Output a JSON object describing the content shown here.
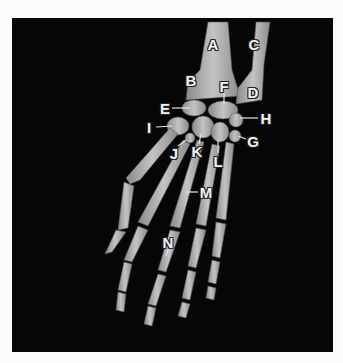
{
  "figure": {
    "background_color": "#060606",
    "bone_color": "#b9b9b9",
    "label_color": "#f2f2f2",
    "labels": [
      {
        "id": "A",
        "text": "A",
        "x": 213,
        "y": 44,
        "target": "radius shaft"
      },
      {
        "id": "C",
        "text": "C",
        "x": 254,
        "y": 44,
        "target": "ulna shaft"
      },
      {
        "id": "B",
        "text": "B",
        "x": 191,
        "y": 80,
        "target": "distal radius"
      },
      {
        "id": "F",
        "text": "F",
        "x": 224,
        "y": 86,
        "target": "carpal"
      },
      {
        "id": "D",
        "text": "D",
        "x": 253,
        "y": 92,
        "target": "distal ulna"
      },
      {
        "id": "E",
        "text": "E",
        "x": 165,
        "y": 108,
        "target": "carpal"
      },
      {
        "id": "H",
        "text": "H",
        "x": 266,
        "y": 118,
        "target": "carpal"
      },
      {
        "id": "I",
        "text": "I",
        "x": 149,
        "y": 127,
        "target": "carpal"
      },
      {
        "id": "G",
        "text": "G",
        "x": 253,
        "y": 141,
        "target": "carpal"
      },
      {
        "id": "J",
        "text": "J",
        "x": 174,
        "y": 153,
        "target": "carpal"
      },
      {
        "id": "K",
        "text": "K",
        "x": 197,
        "y": 151,
        "target": "carpal"
      },
      {
        "id": "L",
        "text": "L",
        "x": 218,
        "y": 161,
        "target": "carpal"
      },
      {
        "id": "M",
        "text": "M",
        "x": 206,
        "y": 192,
        "target": "metacarpal"
      },
      {
        "id": "N",
        "text": "N",
        "x": 168,
        "y": 242,
        "target": "phalanx"
      }
    ]
  }
}
